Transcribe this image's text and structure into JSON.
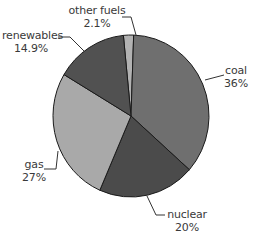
{
  "chart_data": {
    "type": "pie",
    "title": "",
    "start_angle_deg": -5.6,
    "direction": "clockwise",
    "slices": [
      {
        "label": "other fuels",
        "value": 2.1,
        "display": "2.1%",
        "color": "#b2b2b2"
      },
      {
        "label": "coal",
        "value": 36,
        "display": "36%",
        "color": "#6f6f6f"
      },
      {
        "label": "nuclear",
        "value": 20,
        "display": "20%",
        "color": "#4b4b4b"
      },
      {
        "label": "gas",
        "value": 27,
        "display": "27%",
        "color": "#a9a9a9"
      },
      {
        "label": "renewables",
        "value": 14.9,
        "display": "14.9%",
        "color": "#515151"
      }
    ],
    "legend": "none (callout labels with leader lines)"
  },
  "labels": {
    "other_fuels": {
      "name": "other fuels",
      "pct": "2.1%"
    },
    "coal": {
      "name": "coal",
      "pct": "36%"
    },
    "nuclear": {
      "name": "nuclear",
      "pct": "20%"
    },
    "gas": {
      "name": "gas",
      "pct": "27%"
    },
    "renewables": {
      "name": "renewables",
      "pct": "14.9%"
    }
  }
}
